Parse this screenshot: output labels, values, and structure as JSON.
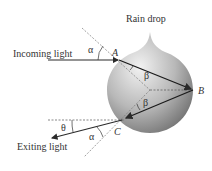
{
  "diagram": {
    "title": "Rain drop",
    "labels": {
      "incoming": "Incoming light",
      "exiting": "Exiting light",
      "point_a": "A",
      "point_b": "B",
      "point_c": "C",
      "alpha_top": "α",
      "alpha_bottom": "α",
      "beta_top": "β",
      "beta_bottom": "β",
      "theta": "θ"
    },
    "colors": {
      "ray": "#2a2a2a",
      "dashed": "#777777",
      "drop_light": "#eeeeee",
      "drop_dark": "#7a7a7a"
    }
  }
}
